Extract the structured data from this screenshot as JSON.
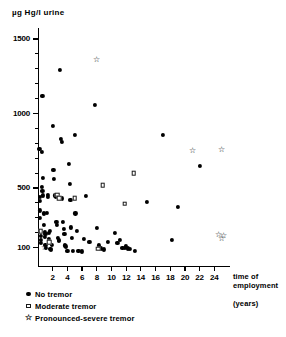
{
  "chart_data": {
    "type": "scatter",
    "title": "",
    "ylabel": "µg Hg/l  urine",
    "xlabel": "time of employment",
    "xlabel_units": "(years)",
    "xlim": [
      0,
      26
    ],
    "ylim": [
      50,
      1600
    ],
    "grid": false,
    "legend_position": "below-left",
    "yticks": [
      100,
      500,
      1000,
      1500
    ],
    "ytick_labels": [
      "100",
      "500",
      "1000",
      "1500"
    ],
    "yticks_minor": [
      200,
      300,
      400,
      600,
      700,
      800,
      900,
      1100,
      1200,
      1300,
      1400
    ],
    "xticks": [
      2,
      4,
      6,
      8,
      10,
      12,
      14,
      16,
      18,
      20,
      22,
      24
    ],
    "xtick_labels": [
      "2",
      "4",
      "6",
      "8",
      "10",
      "12",
      "14",
      "16",
      "18",
      "20",
      "22",
      "24"
    ],
    "series": [
      {
        "name": "No tremor",
        "marker": "filled-circle",
        "color": "#000000",
        "points": [
          [
            0.2,
            760
          ],
          [
            0.3,
            440
          ],
          [
            0.3,
            415
          ],
          [
            0.3,
            350
          ],
          [
            0.3,
            300
          ],
          [
            0.4,
            180
          ],
          [
            0.4,
            150
          ],
          [
            0.4,
            130
          ],
          [
            0.5,
            740
          ],
          [
            0.5,
            505
          ],
          [
            0.6,
            1120
          ],
          [
            0.6,
            480
          ],
          [
            0.7,
            570
          ],
          [
            0.7,
            450
          ],
          [
            0.8,
            330
          ],
          [
            0.8,
            250
          ],
          [
            0.9,
            205
          ],
          [
            0.9,
            170
          ],
          [
            1.0,
            190
          ],
          [
            1.0,
            120
          ],
          [
            1.1,
            100
          ],
          [
            1.2,
            335
          ],
          [
            1.3,
            455
          ],
          [
            1.4,
            440
          ],
          [
            1.5,
            200
          ],
          [
            1.5,
            160
          ],
          [
            1.6,
            210
          ],
          [
            1.7,
            90
          ],
          [
            1.8,
            85
          ],
          [
            1.9,
            120
          ],
          [
            2.0,
            915
          ],
          [
            2.1,
            620
          ],
          [
            2.2,
            560
          ],
          [
            2.3,
            450
          ],
          [
            2.4,
            440
          ],
          [
            2.5,
            275
          ],
          [
            2.6,
            250
          ],
          [
            2.7,
            165
          ],
          [
            2.8,
            150
          ],
          [
            2.9,
            145
          ],
          [
            3.0,
            1290
          ],
          [
            3.1,
            830
          ],
          [
            3.2,
            810
          ],
          [
            3.3,
            430
          ],
          [
            3.4,
            270
          ],
          [
            3.5,
            225
          ],
          [
            3.6,
            190
          ],
          [
            3.7,
            115
          ],
          [
            3.8,
            108
          ],
          [
            4.0,
            78
          ],
          [
            4.2,
            660
          ],
          [
            4.3,
            525
          ],
          [
            4.4,
            420
          ],
          [
            4.5,
            235
          ],
          [
            4.6,
            165
          ],
          [
            4.8,
            78
          ],
          [
            5.0,
            855
          ],
          [
            5.1,
            330
          ],
          [
            5.3,
            210
          ],
          [
            5.5,
            78
          ],
          [
            6.0,
            75
          ],
          [
            6.2,
            160
          ],
          [
            6.5,
            445
          ],
          [
            7.0,
            140
          ],
          [
            7.8,
            1060
          ],
          [
            8.0,
            230
          ],
          [
            8.3,
            115
          ],
          [
            8.6,
            95
          ],
          [
            9.0,
            88
          ],
          [
            9.5,
            140
          ],
          [
            10.5,
            200
          ],
          [
            10.8,
            130
          ],
          [
            11.2,
            150
          ],
          [
            11.5,
            100
          ],
          [
            11.8,
            98
          ],
          [
            12.0,
            112
          ],
          [
            12.2,
            95
          ],
          [
            12.5,
            92
          ],
          [
            13.2,
            78
          ],
          [
            14.8,
            405
          ],
          [
            17.0,
            855
          ],
          [
            18.2,
            150
          ],
          [
            19.0,
            375
          ],
          [
            22.0,
            650
          ]
        ]
      },
      {
        "name": "Moderate tremor",
        "marker": "open-square",
        "color": "#1a1a1a",
        "points": [
          [
            0.35,
            210
          ],
          [
            1.5,
            135
          ],
          [
            2.6,
            455
          ],
          [
            2.9,
            430
          ],
          [
            5.0,
            430
          ],
          [
            8.2,
            92
          ],
          [
            8.8,
            520
          ],
          [
            11.8,
            395
          ],
          [
            13.0,
            600
          ]
        ]
      },
      {
        "name": "Pronounced-severe tremor",
        "marker": "star",
        "color": "#000000",
        "points": [
          [
            0.9,
            100
          ],
          [
            8.0,
            1360
          ],
          [
            21.0,
            750
          ],
          [
            25.0,
            755
          ],
          [
            24.6,
            185
          ],
          [
            25.3,
            175
          ],
          [
            25.0,
            158
          ]
        ]
      }
    ]
  },
  "legend": {
    "items": [
      {
        "label": "No tremor",
        "marker": "filled-circle"
      },
      {
        "label": "Moderate tremor",
        "marker": "open-square"
      },
      {
        "label": "Pronounced-severe tremor",
        "marker": "star"
      }
    ]
  }
}
